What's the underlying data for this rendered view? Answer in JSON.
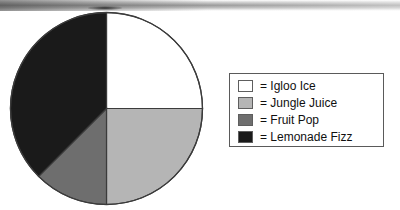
{
  "chart_data": {
    "type": "pie",
    "title": "",
    "labels": [
      "Igloo Ice",
      "Jungle Juice",
      "Fruit Pop",
      "Lemonade Fizz"
    ],
    "values": [
      25,
      25,
      12.5,
      37.5
    ],
    "units": "percent",
    "angles_deg": [
      90,
      90,
      45,
      135
    ],
    "start_angle_deg": 0,
    "direction": "clockwise",
    "colors": [
      "#ffffff",
      "#b5b5b5",
      "#6e6e6e",
      "#1a1a1a"
    ],
    "legend_position": "right",
    "grid": false,
    "slices": [
      {
        "label": "Igloo Ice",
        "value": 25,
        "color": "#ffffff",
        "start_deg": 0,
        "end_deg": 90
      },
      {
        "label": "Jungle Juice",
        "value": 25,
        "color": "#b5b5b5",
        "start_deg": 90,
        "end_deg": 180
      },
      {
        "label": "Fruit Pop",
        "value": 12.5,
        "color": "#6e6e6e",
        "start_deg": 180,
        "end_deg": 225
      },
      {
        "label": "Lemonade Fizz",
        "value": 37.5,
        "color": "#1a1a1a",
        "start_deg": 225,
        "end_deg": 360
      }
    ]
  },
  "legend": {
    "equals_sign": "=",
    "entries": [
      {
        "label": "Igloo Ice",
        "color": "#ffffff"
      },
      {
        "label": "Jungle Juice",
        "color": "#b5b5b5"
      },
      {
        "label": "Fruit Pop",
        "color": "#6e6e6e"
      },
      {
        "label": "Lemonade Fizz",
        "color": "#1a1a1a"
      }
    ],
    "rows": [
      {
        "text": "= Igloo Ice"
      },
      {
        "text": "= Jungle Juice"
      },
      {
        "text": "= Fruit Pop"
      },
      {
        "text": "= Lemonade Fizz"
      }
    ]
  }
}
